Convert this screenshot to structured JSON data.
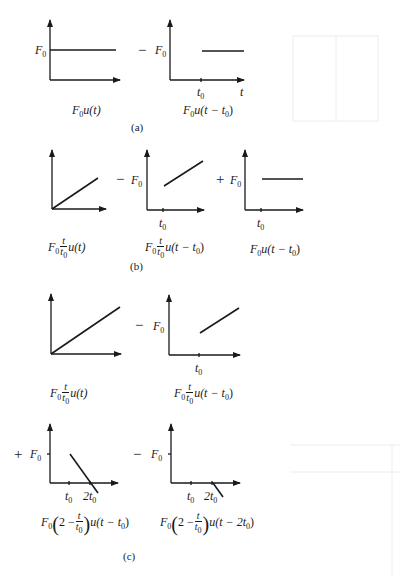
{
  "figure": {
    "parts": [
      {
        "id": "a",
        "caption": "(a)",
        "operators": [
          "−"
        ],
        "plots": [
          {
            "label": "F0u(t)",
            "y_label": "F0",
            "x_ticks": [],
            "shape": "step at 0 to F0"
          },
          {
            "label": "F0u(t − t0)",
            "y_label": "F0",
            "x_ticks": [
              "t0"
            ],
            "x_axis_label": "t",
            "shape": "step at t0 to F0"
          }
        ]
      },
      {
        "id": "b",
        "caption": "(b)",
        "operators": [
          "−",
          "+"
        ],
        "plots": [
          {
            "label": "F0 (t/t0) u(t)",
            "shape": "ramp from origin"
          },
          {
            "label": "F0 (t/t0) u(t − t0)",
            "y_label": "F0",
            "x_ticks": [
              "t0"
            ],
            "shape": "ramp starting at t0 from F0"
          },
          {
            "label": "F0u(t − t0)",
            "y_label": "F0",
            "x_ticks": [
              "t0"
            ],
            "shape": "step at t0 to F0"
          }
        ]
      },
      {
        "id": "c",
        "caption": "(c)",
        "operators": [
          "−",
          "+",
          "−"
        ],
        "plots": [
          {
            "label": "F0 (t/t0) u(t)",
            "shape": "ramp from origin"
          },
          {
            "label": "F0 (t/t0) u(t − t0)",
            "y_label": "F0",
            "x_ticks": [
              "t0"
            ],
            "shape": "ramp starting at t0 from F0"
          },
          {
            "label": "F0 (2 − t/t0) u(t − t0)",
            "y_label": "F0",
            "x_ticks": [
              "t0",
              "2t0"
            ],
            "shape": "decreasing ramp from F0 at t0 crossing zero at 2t0"
          },
          {
            "label": "F0 (2 − t/t0) u(t − 2t0)",
            "y_label": "F0",
            "x_ticks": [
              "t0",
              "2t0"
            ],
            "shape": "decreasing ramp starting at 2t0 from 0"
          }
        ]
      }
    ],
    "symbols": {
      "F": "F",
      "zero": "0",
      "t": "t",
      "u": "u",
      "two": "2",
      "minus": "−",
      "plus": "+",
      "lparen": "(",
      "rparen": ")",
      "open": "(",
      "close": ")"
    },
    "labels": {
      "a_eq1_tail": "u(t)",
      "a_eq2_tail": "u(t − t",
      "b_eq1_tail": "u(t)",
      "b_eq2_tail": "u(t − t",
      "b_eq3_tail": "u(t − t",
      "c_eq1_tail": "u(t)",
      "c_eq2_tail": "u(t − t",
      "c_eq3_tail": "u(t − t",
      "c_eq4_tail": "u(t − 2t",
      "two_minus": "2 −",
      "two_t": "2t"
    }
  }
}
